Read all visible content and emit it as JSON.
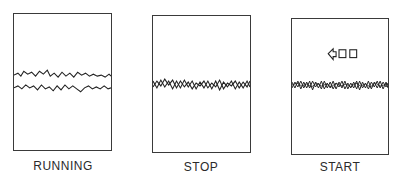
{
  "figure": {
    "panels": [
      {
        "id": "running",
        "label": "RUNNING",
        "description": "two separate wavy traces"
      },
      {
        "id": "stop",
        "label": "STOP",
        "description": "two traces overlapping/crossing"
      },
      {
        "id": "start",
        "label": "START",
        "description": "overlapping traces with left-pointing arrow and two squares above",
        "indicator": {
          "icon": "arrow-left-icon",
          "squares": 2
        }
      }
    ]
  }
}
